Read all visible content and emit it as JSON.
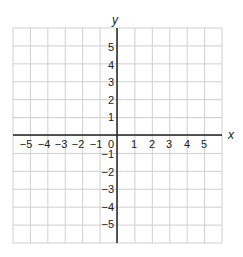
{
  "chart_data": {
    "type": "scatter",
    "title": "",
    "xlabel": "x",
    "ylabel": "y",
    "xlim": [
      -6,
      6
    ],
    "ylim": [
      -6,
      6
    ],
    "grid": true,
    "x_ticks": [
      "−5",
      "−4",
      "−3",
      "−2",
      "−1",
      "0",
      "1",
      "2",
      "3",
      "4",
      "5"
    ],
    "y_ticks": [
      "5",
      "4",
      "3",
      "2",
      "1",
      "−1",
      "−2",
      "−3",
      "−4",
      "−5"
    ],
    "series": []
  },
  "colors": {
    "grid": "#cfcfcf",
    "axis": "#222222"
  }
}
